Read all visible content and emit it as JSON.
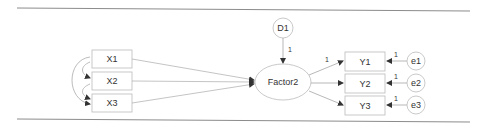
{
  "diagram": {
    "type": "path-diagram",
    "observed_exogenous": [
      {
        "id": "X1",
        "label": "X1"
      },
      {
        "id": "X2",
        "label": "X2"
      },
      {
        "id": "X3",
        "label": "X3"
      }
    ],
    "latent": {
      "id": "Factor2",
      "label": "Factor2"
    },
    "disturbance": {
      "id": "D1",
      "label": "D1",
      "path_label": "1"
    },
    "indicators": [
      {
        "id": "Y1",
        "label": "Y1",
        "error": "e1",
        "error_path_label": "1",
        "loading_label": "1"
      },
      {
        "id": "Y2",
        "label": "Y2",
        "error": "e2",
        "error_path_label": "1",
        "loading_label": ""
      },
      {
        "id": "Y3",
        "label": "Y3",
        "error": "e3",
        "error_path_label": "1",
        "loading_label": ""
      }
    ],
    "covariances": [
      "X1-X2",
      "X2-X3",
      "X1-X3"
    ],
    "colors": {
      "stroke": "#9a9a9a",
      "text": "#333333",
      "rule": "#8c8c8c"
    }
  }
}
